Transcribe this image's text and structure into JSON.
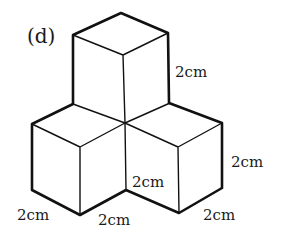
{
  "figure": {
    "part_label": "(d)",
    "line_color": "#111111",
    "background": "#ffffff"
  },
  "labels": {
    "top_right_edge": "2cm",
    "right_edge": "2cm",
    "middle_edge": "2cm",
    "bottom_left": "2cm",
    "bottom_middle": "2cm",
    "bottom_right": "2cm"
  }
}
